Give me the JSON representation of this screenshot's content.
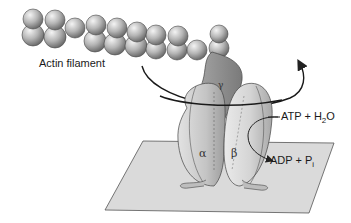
{
  "diagram": {
    "labels": {
      "actin_filament": "Actin filament",
      "gamma": "γ",
      "alpha": "α",
      "beta": "β",
      "atp_text": "ATP + H",
      "atp_sub": "2",
      "atp_tail": "O",
      "adp_text": "ADP + P",
      "adp_sub": "i"
    },
    "colors": {
      "sphere": "#b8b8b8",
      "enzyme": "#cfcfcf",
      "gamma": "#8f8f8f",
      "plane": "#d9d9d9",
      "outline": "#333333"
    }
  }
}
